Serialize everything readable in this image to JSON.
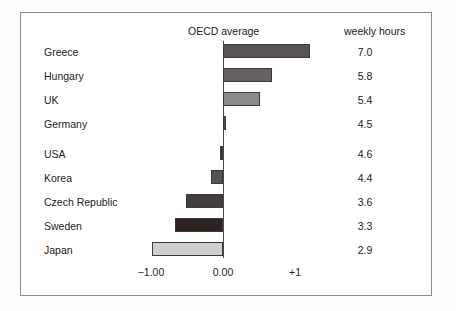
{
  "figure": {
    "oecd_header": "OECD average",
    "hours_header": "weekly hours"
  },
  "axis": {
    "ticks": [
      {
        "label": "−1.00",
        "value": -1.0
      },
      {
        "label": "0.00",
        "value": 0.0
      },
      {
        "label": "+1",
        "value": 1.0
      }
    ]
  },
  "chart_data": {
    "type": "bar",
    "orientation": "horizontal",
    "title": "",
    "subtitle": "",
    "xlabel": "OECD average",
    "ylabel": "",
    "xlim": [
      -1.25,
      1.45
    ],
    "grid": false,
    "legend": null,
    "baseline": 0.0,
    "categories": [
      "Greece",
      "Hungary",
      "UK",
      "Germany",
      "USA",
      "Korea",
      "Czech Republic",
      "Sweden",
      "Japan"
    ],
    "series": [
      {
        "name": "Deviation from OECD average",
        "values": [
          1.21,
          0.68,
          0.52,
          0.02,
          -0.04,
          -0.17,
          -0.52,
          -0.66,
          -0.98
        ]
      },
      {
        "name": "weekly hours",
        "values": [
          7.0,
          5.8,
          5.4,
          4.5,
          4.6,
          4.4,
          3.6,
          3.3,
          2.9
        ]
      }
    ],
    "annotations": [
      {
        "text": "OECD average",
        "type": "column-header"
      },
      {
        "text": "weekly hours",
        "type": "column-header"
      }
    ],
    "bar_colors": [
      "#575451",
      "#64615e",
      "#8c8a87",
      "#4d4a47",
      "#383532",
      "#55524f",
      "#413e3b",
      "#2b2320",
      "#cfcfcb"
    ]
  },
  "rows": [
    {
      "label": "Greece",
      "hours": "7.0",
      "value": 1.21,
      "color": "#575451"
    },
    {
      "label": "Hungary",
      "hours": "5.8",
      "value": 0.68,
      "color": "#64615e"
    },
    {
      "label": "UK",
      "hours": "5.4",
      "value": 0.52,
      "color": "#8c8a87"
    },
    {
      "label": "Germany",
      "hours": "4.5",
      "value": 0.02,
      "color": "#4d4a47"
    },
    {
      "label": "USA",
      "hours": "4.6",
      "value": -0.04,
      "color": "#383532"
    },
    {
      "label": "Korea",
      "hours": "4.4",
      "value": -0.17,
      "color": "#55524f"
    },
    {
      "label": "Czech Republic",
      "hours": "3.6",
      "value": -0.52,
      "color": "#413e3b"
    },
    {
      "label": "Sweden",
      "hours": "3.3",
      "value": -0.66,
      "color": "#2b2320"
    },
    {
      "label": "Japan",
      "hours": "2.9",
      "value": -0.98,
      "color": "#cfcfcb"
    }
  ]
}
